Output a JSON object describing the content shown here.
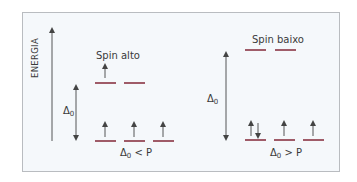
{
  "diagram": {
    "type": "crystal-field-splitting",
    "axis_label": "ENERGIA",
    "colors": {
      "orbital": "#8a3444",
      "arrow": "#444444",
      "background": "#f5f8fb",
      "border": "#b9bcc0"
    },
    "panels": [
      {
        "id": "high-spin",
        "title": "Spin alto",
        "gap_label": "Δ",
        "gap_sub": "0",
        "condition_symbol": "Δ",
        "condition_sub": "0",
        "condition_rest": " < P",
        "upper_orbitals": [
          {
            "electrons": "↑"
          },
          {
            "electrons": ""
          }
        ],
        "lower_orbitals": [
          {
            "electrons": "↑"
          },
          {
            "electrons": "↑"
          },
          {
            "electrons": "↑"
          }
        ]
      },
      {
        "id": "low-spin",
        "title": "Spin baixo",
        "gap_label": "Δ",
        "gap_sub": "0",
        "condition_symbol": "Δ",
        "condition_sub": "0",
        "condition_rest": " > P",
        "upper_orbitals": [
          {
            "electrons": ""
          },
          {
            "electrons": ""
          }
        ],
        "lower_orbitals": [
          {
            "electrons": "↑↓"
          },
          {
            "electrons": "↑"
          },
          {
            "electrons": "↑"
          }
        ]
      }
    ]
  }
}
